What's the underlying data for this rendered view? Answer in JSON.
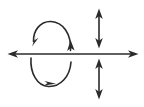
{
  "figure": {
    "background_color": "#ffffff",
    "stroke_color": "#2b2b2b",
    "stroke_width": 1.6,
    "width": 144,
    "height": 107
  },
  "chart_data": {
    "type": "diagram",
    "title": "",
    "subtitle": "",
    "xlabel": "",
    "ylabel": "",
    "grid": false,
    "legend": null,
    "annotations": [],
    "tick_labels": [],
    "axis": {
      "name": "horizontal-axis",
      "orientation": "horizontal",
      "y": 54,
      "x_start": 8,
      "x_end": 138,
      "arrowheads": [
        "left",
        "right"
      ],
      "double_headed": true
    },
    "elements": [
      {
        "name": "circulation-loop",
        "shape": "ellipse",
        "center_x": 51,
        "center_y": 54,
        "radius_x": 21,
        "radius_y": 33,
        "closed": false,
        "arrowheads": [
          {
            "id": "loop-arrow-upper-left",
            "at_x": 34,
            "at_y": 42,
            "direction": "down-left",
            "angle_deg": 215
          },
          {
            "id": "loop-arrow-right",
            "at_x": 70,
            "at_y": 46,
            "direction": "up",
            "angle_deg": 345
          },
          {
            "id": "loop-arrow-bottom",
            "at_x": 50,
            "at_y": 82,
            "direction": "right",
            "angle_deg": 20
          }
        ]
      },
      {
        "name": "vertical-arrow-above-axis",
        "shape": "segment",
        "orientation": "vertical",
        "x": 99,
        "y_start": 9,
        "y_end": 48,
        "arrowheads": [
          "up",
          "down"
        ],
        "double_headed": true
      },
      {
        "name": "vertical-arrow-below-axis",
        "shape": "segment",
        "orientation": "vertical",
        "x": 99,
        "y_start": 59,
        "y_end": 99,
        "arrowheads": [
          "up",
          "down"
        ],
        "double_headed": true
      }
    ]
  }
}
